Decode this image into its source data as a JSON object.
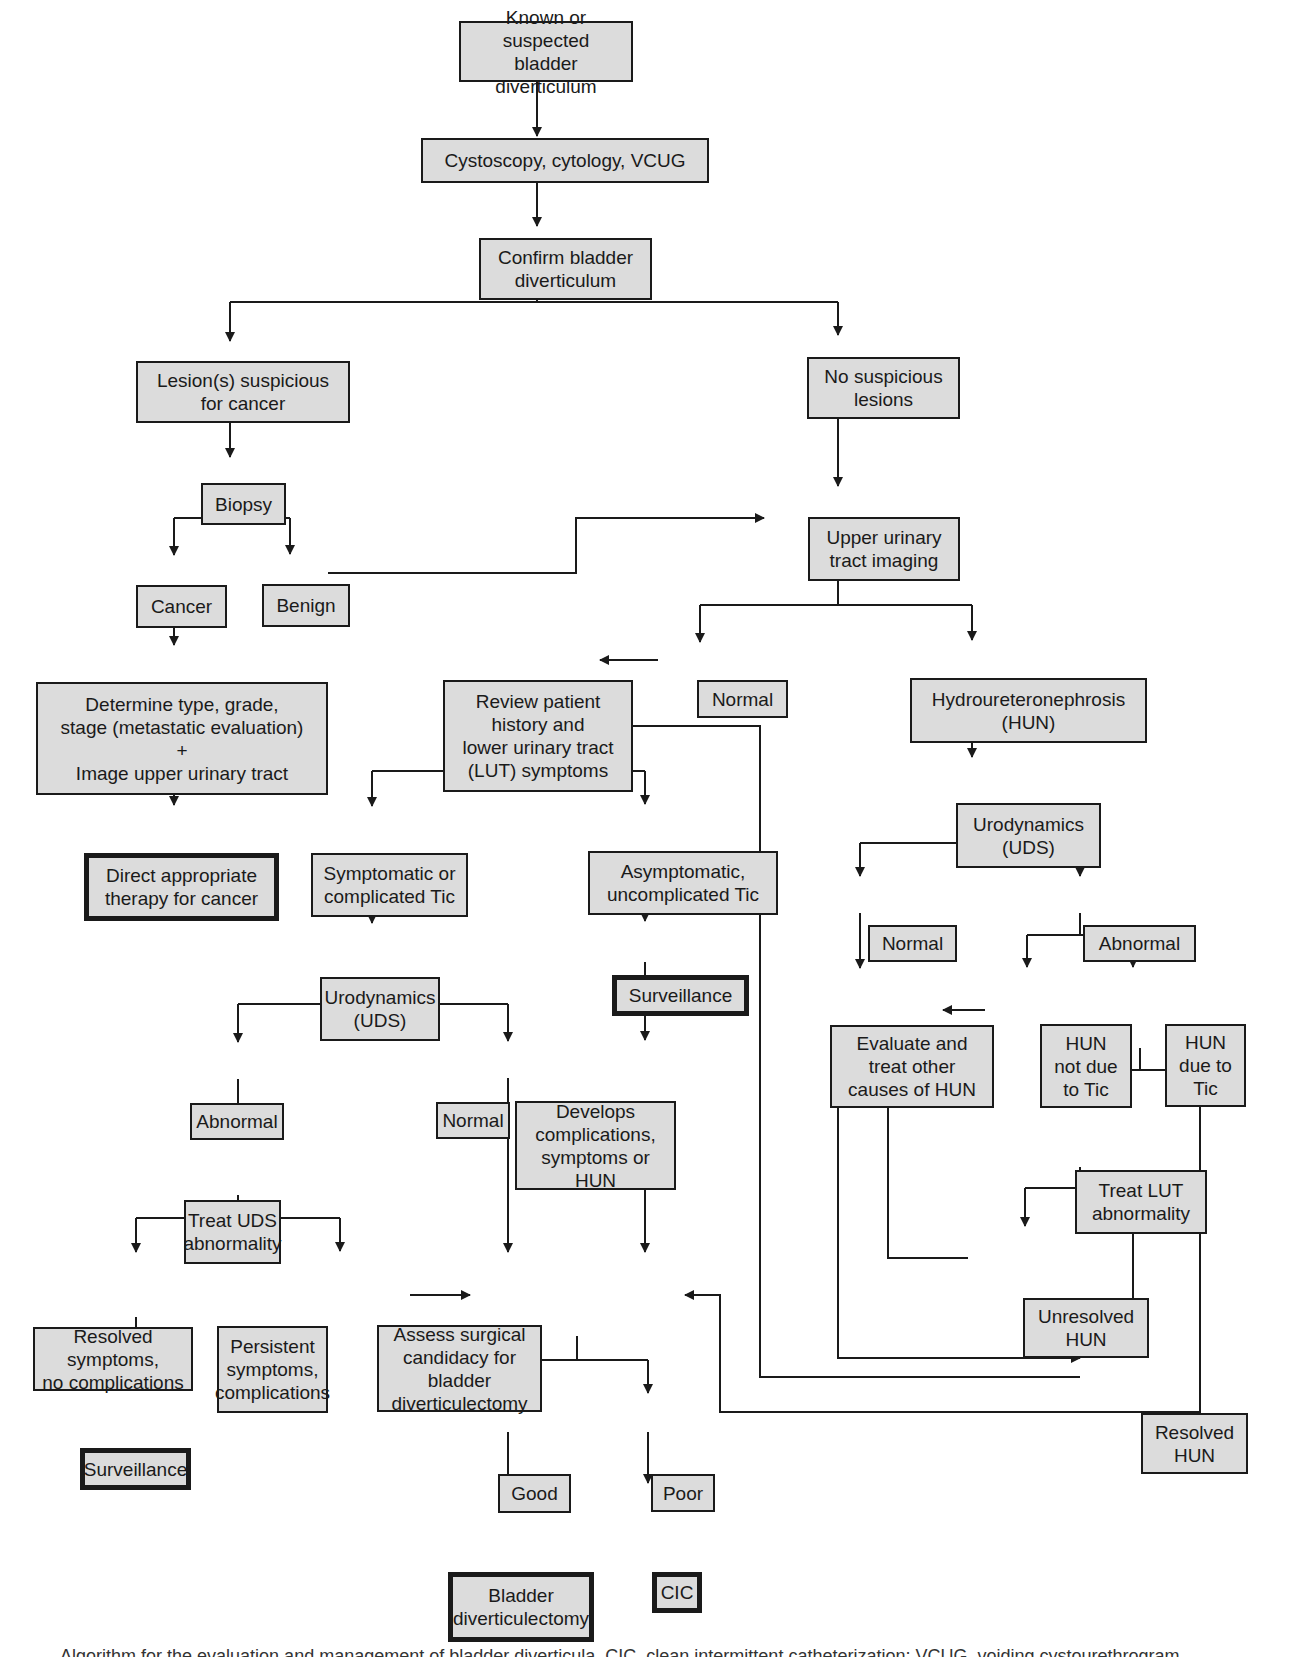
{
  "figure": {
    "title": "Algorithm for the evaluation and management of bladder diverticula",
    "nodes": {
      "start": "Known or suspected\nbladder diverticulum",
      "cysto": "Cystoscopy, cytology, VCUG",
      "confirm": "Confirm bladder\ndiverticulum",
      "lesion": "Lesion(s) suspicious\nfor cancer",
      "nolesion": "No suspicious\nlesions",
      "biopsy": "Biopsy",
      "cancer": "Cancer",
      "benign": "Benign",
      "uuti": "Upper urinary\ntract imaging",
      "determine": "Determine type, grade,\nstage (metastatic evaluation)\n+\nImage upper urinary tract",
      "direct": "Direct appropriate\ntherapy for cancer",
      "normal_img": "Normal",
      "review": "Review patient\nhistory and\nlower urinary tract\n(LUT) symptoms",
      "hun": "Hydroureteronephrosis\n(HUN)",
      "symptomatic": "Symptomatic or\ncomplicated Tic",
      "asymptomatic": "Asymptomatic,\nuncomplicated Tic",
      "uds_right": "Urodynamics\n(UDS)",
      "surveillance_mid": "Surveillance",
      "uds_left": "Urodynamics\n(UDS)",
      "normal_r": "Normal",
      "abnormal_r": "Abnormal",
      "evaluate": "Evaluate and\ntreat other\ncauses of HUN",
      "hun_not": "HUN\nnot due\nto Tic",
      "hun_due": "HUN\ndue to\nTic",
      "abnormal_l": "Abnormal",
      "normal_l": "Normal",
      "develops": "Develops\ncomplications,\nsymptoms or HUN",
      "treat_lut": "Treat LUT\nabnormality",
      "treat_uds": "Treat UDS\nabnormality",
      "unresolved": "Unresolved\nHUN",
      "resolved_sym": "Resolved symptoms,\nno complications",
      "persistent": "Persistent\nsymptoms,\ncomplications",
      "assess": "Assess surgical\ncandidacy for bladder\ndiverticulectomy",
      "resolved_hun": "Resolved\nHUN",
      "surveillance_left": "Surveillance",
      "good": "Good",
      "poor": "Poor",
      "bladder_div": "Bladder\ndiverticulectomy",
      "cic": "CIC"
    },
    "caption": "Algorithm for the evaluation and management of bladder diverticula. CIC, clean intermittent catheterization; VCUG, voiding cystourethrogram"
  },
  "colors": {
    "box_fill": "#dcdcdc",
    "line": "#1a1a1a",
    "background": "#ffffff"
  }
}
